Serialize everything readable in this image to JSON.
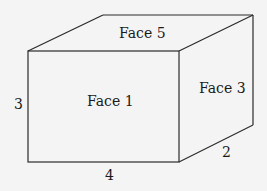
{
  "diagram": {
    "type": "rectangular-prism",
    "faces": {
      "front": "Face 1",
      "right": "Face 3",
      "top": "Face 5"
    },
    "dimensions": {
      "height": "3",
      "length": "4",
      "depth": "2"
    },
    "colors": {
      "line": "#2a2a2a",
      "background": "#f4f4f4",
      "text": "#1a1a1a"
    }
  }
}
